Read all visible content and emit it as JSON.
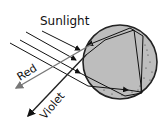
{
  "diagram": {
    "labels": {
      "sunlight": "Sunlight",
      "red": "Red",
      "violet": "Violet"
    },
    "colors": {
      "drop_fill": "#bdbdbd",
      "drop_stroke": "#222222",
      "ray": "#111111",
      "red_ray": "#777777",
      "violet_ray": "#222222",
      "background": "#ffffff"
    }
  }
}
